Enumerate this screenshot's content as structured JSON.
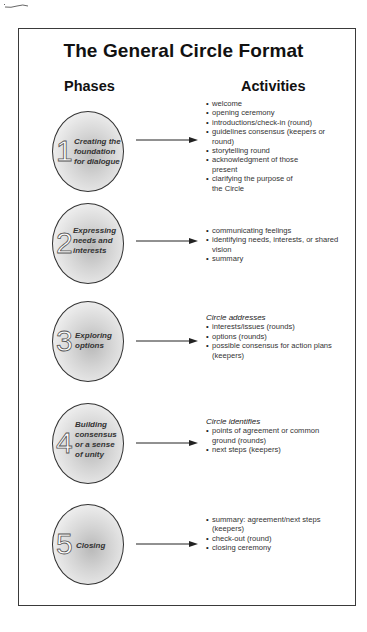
{
  "title": "The General Circle Format",
  "columns": {
    "phases": "Phases",
    "activities": "Activities"
  },
  "phases": [
    {
      "number": "1",
      "label": [
        "Creating the",
        "foundation",
        "for dialogue"
      ],
      "lead": "",
      "activities": [
        "welcome",
        "opening ceremony",
        "introductions/check-in (round)",
        "guidelines consensus (keepers or round)",
        "storytelling round",
        "acknowledgment of those present",
        "clarifying the purpose of the Circle"
      ]
    },
    {
      "number": "2",
      "label": [
        "Expressing",
        "needs and",
        "interests"
      ],
      "lead": "",
      "activities": [
        "communicating feelings",
        "identifying needs, interests, or shared vision",
        "summary"
      ]
    },
    {
      "number": "3",
      "label": [
        "Exploring",
        "options"
      ],
      "lead": "Circle addresses",
      "activities": [
        "interests/issues (rounds)",
        "options (rounds)",
        "possible consensus for action plans (keepers)"
      ]
    },
    {
      "number": "4",
      "label": [
        "Building",
        "consensus",
        "or a sense",
        "of unity"
      ],
      "lead": "Circle identifies",
      "activities": [
        "points of agreement or common ground (rounds)",
        "next steps (keepers)"
      ]
    },
    {
      "number": "5",
      "label": [
        "Closing"
      ],
      "lead": "",
      "activities": [
        "summary: agreement/next steps (keepers)",
        "check-out (round)",
        "closing ceremony"
      ]
    }
  ]
}
